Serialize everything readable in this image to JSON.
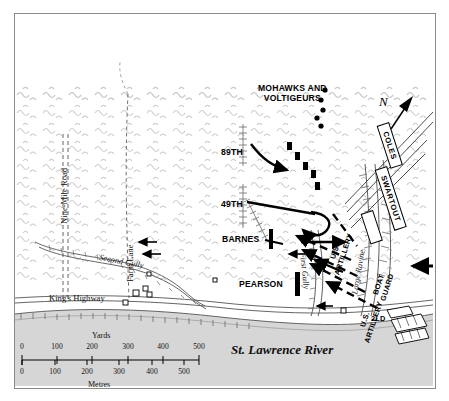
{
  "title": {
    "main": "Crysler's Farm",
    "subtitle": "Phase 4: c. 3:30 – 4:30 PM"
  },
  "compass": {
    "label": "N",
    "icon": "north-arrow-icon"
  },
  "units": {
    "mohawks": "MOHAWKS AND\nVOLTIGEURS",
    "mohawks_line1": "MOHAWKS AND",
    "mohawks_line2": "VOLTIGEURS",
    "b89th": "89TH",
    "b49th": "49TH",
    "barnes": "BARNES",
    "pearson": "PEARSON",
    "coles": "COLES",
    "swartout": "SWARTOUT",
    "boat_guard_line1": "BOAT",
    "boat_guard_line2": "GUARD",
    "us_artillery_line1": "U.S.",
    "us_artillery_line2": "ARTILLERY",
    "us_artillery_right_line1": "U.S.",
    "us_artillery_right_line2": "ARTILLERY",
    "second_light_dragoons": "2LD"
  },
  "terrain": {
    "second_gully": "Second Gully",
    "first_gully": "First Gully",
    "large_ravine": "Large Ravine",
    "river": "St. Lawrence River"
  },
  "roads": {
    "nine_mile_road": "Nine-Mile Road",
    "farm_lane": "Farm Lane",
    "kings_highway": "King's Highway"
  },
  "scale": {
    "yards_caption": "Yards",
    "metres_caption": "Metres",
    "yards_ticks": [
      "0",
      "100",
      "200",
      "300",
      "400",
      "500"
    ],
    "metres_ticks": [
      "0",
      "100",
      "200",
      "300",
      "400",
      "500"
    ]
  },
  "colors": {
    "frame": "#8a8a8a",
    "ink": "#000000",
    "water": "#d6d6d6",
    "woodland": "#c9c9c9",
    "paper": "#ffffff"
  }
}
